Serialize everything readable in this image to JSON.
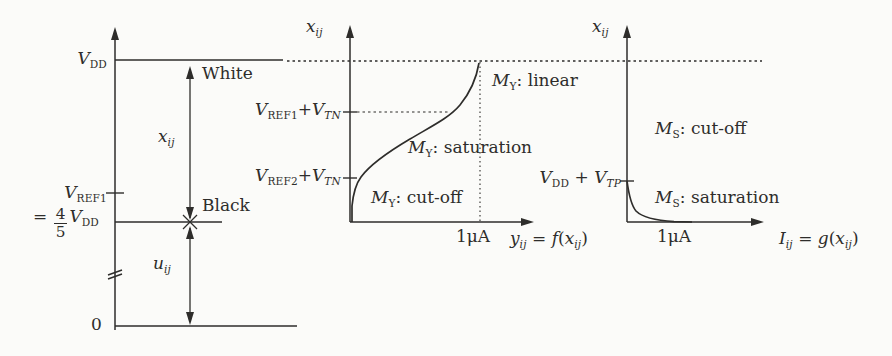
{
  "colors": {
    "ink": "#2e2d2b",
    "paper": "#fbfbf9"
  },
  "left_panel": {
    "vdd_label": [
      {
        "t": "var",
        "v": "V"
      },
      {
        "t": "sub",
        "v": "DD"
      }
    ],
    "vref1_label": [
      {
        "t": "var",
        "v": "V"
      },
      {
        "t": "sub",
        "v": "REF1"
      }
    ],
    "eq_four_fifths": [
      {
        "t": "txt",
        "v": "= "
      },
      {
        "t": "frac",
        "num": "4",
        "den": "5"
      },
      {
        "t": "var",
        "v": "V"
      },
      {
        "t": "sub",
        "v": "DD"
      }
    ],
    "zero_label": "0",
    "white_label": "White",
    "black_label": "Black",
    "x_arrow_label": [
      {
        "t": "var",
        "v": "x"
      },
      {
        "t": "subi",
        "v": "ij"
      }
    ],
    "u_arrow_label": [
      {
        "t": "var",
        "v": "u"
      },
      {
        "t": "subi",
        "v": "ij"
      }
    ]
  },
  "middle_panel": {
    "y_axis_label": [
      {
        "t": "var",
        "v": "x"
      },
      {
        "t": "subi",
        "v": "ij"
      }
    ],
    "tick_vref1_vtn": [
      {
        "t": "var",
        "v": "V"
      },
      {
        "t": "sub",
        "v": "REF1"
      },
      {
        "t": "txt",
        "v": "+"
      },
      {
        "t": "var",
        "v": "V"
      },
      {
        "t": "subi",
        "v": "TN"
      }
    ],
    "tick_vref2_vtn": [
      {
        "t": "var",
        "v": "V"
      },
      {
        "t": "sub",
        "v": "REF2"
      },
      {
        "t": "txt",
        "v": "+"
      },
      {
        "t": "var",
        "v": "V"
      },
      {
        "t": "subi",
        "v": "TN"
      }
    ],
    "region_linear": [
      {
        "t": "var",
        "v": "M"
      },
      {
        "t": "sub",
        "v": "Y"
      },
      {
        "t": "txt",
        "v": ": linear"
      }
    ],
    "region_saturation": [
      {
        "t": "var",
        "v": "M"
      },
      {
        "t": "sub",
        "v": "Y"
      },
      {
        "t": "txt",
        "v": ": saturation"
      }
    ],
    "region_cutoff": [
      {
        "t": "var",
        "v": "M"
      },
      {
        "t": "sub",
        "v": "Y"
      },
      {
        "t": "txt",
        "v": ": cut-off"
      }
    ],
    "x_tick_current": "1μA",
    "x_axis_label": [
      {
        "t": "var",
        "v": "y"
      },
      {
        "t": "subi",
        "v": "ij"
      },
      {
        "t": "txt",
        "v": " = "
      },
      {
        "t": "var",
        "v": "f"
      },
      {
        "t": "txt",
        "v": "("
      },
      {
        "t": "var",
        "v": "x"
      },
      {
        "t": "subi",
        "v": "ij"
      },
      {
        "t": "txt",
        "v": ")"
      }
    ]
  },
  "right_panel": {
    "y_axis_label": [
      {
        "t": "var",
        "v": "x"
      },
      {
        "t": "subi",
        "v": "ij"
      }
    ],
    "tick_vdd_vtp": [
      {
        "t": "var",
        "v": "V"
      },
      {
        "t": "sub",
        "v": "DD"
      },
      {
        "t": "txt",
        "v": " + "
      },
      {
        "t": "var",
        "v": "V"
      },
      {
        "t": "subi",
        "v": "TP"
      }
    ],
    "region_cutoff": [
      {
        "t": "var",
        "v": "M"
      },
      {
        "t": "sub",
        "v": "S"
      },
      {
        "t": "txt",
        "v": ": cut-off"
      }
    ],
    "region_saturation": [
      {
        "t": "var",
        "v": "M"
      },
      {
        "t": "sub",
        "v": "S"
      },
      {
        "t": "txt",
        "v": ": saturation"
      }
    ],
    "x_tick_current": "1μA",
    "x_axis_label": [
      {
        "t": "var",
        "v": "I"
      },
      {
        "t": "subi",
        "v": "ij"
      },
      {
        "t": "txt",
        "v": " = "
      },
      {
        "t": "var",
        "v": "g"
      },
      {
        "t": "txt",
        "v": "("
      },
      {
        "t": "var",
        "v": "x"
      },
      {
        "t": "subi",
        "v": "ij"
      },
      {
        "t": "txt",
        "v": ")"
      }
    ]
  }
}
